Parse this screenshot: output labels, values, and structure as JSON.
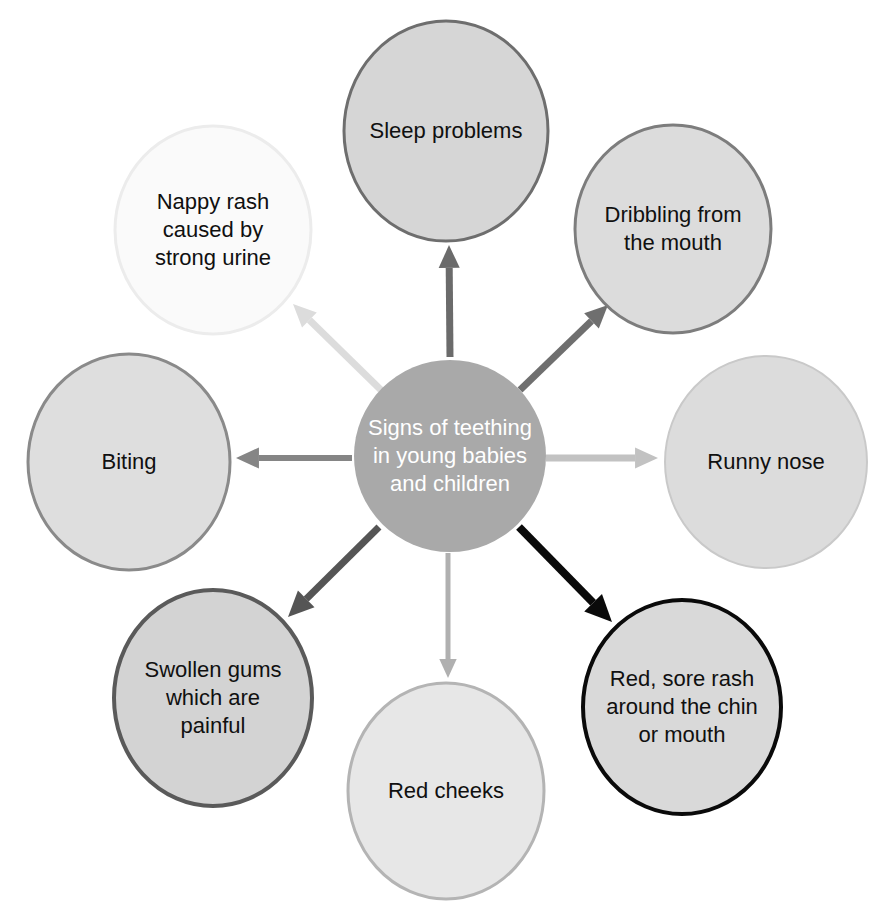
{
  "diagram": {
    "title": "Signs of teething in young babies and children",
    "type": "radial-hub-and-spoke",
    "canvas": {
      "width": 891,
      "height": 920,
      "background": "#ffffff"
    },
    "center": {
      "id": "center-node",
      "label": "Signs of teething\nin young babies\nand children",
      "label_lines": [
        "Signs of teething",
        "in young babies",
        "and children"
      ],
      "cx": 450,
      "cy": 456,
      "rx": 96,
      "ry": 96,
      "fill": "#a9a9a9",
      "stroke": "#a9a9a9",
      "stroke_width": 0,
      "text_color": "#ffffff",
      "font_size": 22
    },
    "nodes": [
      {
        "id": "node-sleep-problems",
        "label": "Sleep problems",
        "label_lines": [
          "Sleep problems"
        ],
        "cx": 446,
        "cy": 131,
        "rx": 102,
        "ry": 110,
        "fill": "#d6d6d6",
        "stroke": "#6e6e6e",
        "stroke_width": 3,
        "text_color": "#101010",
        "font_size": 22
      },
      {
        "id": "node-dribbling",
        "label": "Dribbling from\nthe mouth",
        "label_lines": [
          "Dribbling from",
          "the mouth"
        ],
        "cx": 673,
        "cy": 229,
        "rx": 98,
        "ry": 104,
        "fill": "#dcdcdc",
        "stroke": "#7d7d7d",
        "stroke_width": 3,
        "text_color": "#101010",
        "font_size": 22
      },
      {
        "id": "node-runny-nose",
        "label": "Runny nose",
        "label_lines": [
          "Runny nose"
        ],
        "cx": 766,
        "cy": 462,
        "rx": 101,
        "ry": 106,
        "fill": "#dcdcdc",
        "stroke": "#c9c9c9",
        "stroke_width": 2,
        "text_color": "#101010",
        "font_size": 22
      },
      {
        "id": "node-red-sore-rash",
        "label": "Red, sore rash\naround the chin\nor mouth",
        "label_lines": [
          "Red, sore rash",
          "around the chin",
          "or mouth"
        ],
        "cx": 682,
        "cy": 707,
        "rx": 99,
        "ry": 107,
        "fill": "#d9d9d9",
        "stroke": "#0a0a0a",
        "stroke_width": 4,
        "text_color": "#101010",
        "font_size": 22
      },
      {
        "id": "node-red-cheeks",
        "label": "Red cheeks",
        "label_lines": [
          "Red cheeks"
        ],
        "cx": 446,
        "cy": 791,
        "rx": 98,
        "ry": 108,
        "fill": "#e7e7e7",
        "stroke": "#b4b4b4",
        "stroke_width": 3,
        "text_color": "#101010",
        "font_size": 22
      },
      {
        "id": "node-swollen-gums",
        "label": "Swollen gums\nwhich are\npainful",
        "label_lines": [
          "Swollen gums",
          "which are",
          "painful"
        ],
        "cx": 213,
        "cy": 698,
        "rx": 99,
        "ry": 108,
        "fill": "#d3d3d3",
        "stroke": "#5a5a5a",
        "stroke_width": 4,
        "text_color": "#101010",
        "font_size": 22
      },
      {
        "id": "node-biting",
        "label": "Biting",
        "label_lines": [
          "Biting"
        ],
        "cx": 129,
        "cy": 462,
        "rx": 101,
        "ry": 108,
        "fill": "#dedede",
        "stroke": "#8a8a8a",
        "stroke_width": 3,
        "text_color": "#101010",
        "font_size": 22
      },
      {
        "id": "node-nappy-rash",
        "label": "Nappy rash\ncaused by\nstrong urine",
        "label_lines": [
          "Nappy rash",
          "caused by",
          "strong urine"
        ],
        "cx": 213,
        "cy": 230,
        "rx": 98,
        "ry": 104,
        "fill": "#fafafa",
        "stroke": "#ececec",
        "stroke_width": 3,
        "text_color": "#101010",
        "font_size": 22
      }
    ],
    "arrows": [
      {
        "id": "arrow-to-sleep-problems",
        "from": "center-node",
        "to": "node-sleep-problems",
        "x1": 450,
        "y1": 357,
        "x2": 449,
        "y2": 245,
        "color": "#6b6b6b",
        "width": 7,
        "head": 17
      },
      {
        "id": "arrow-to-dribbling",
        "from": "center-node",
        "to": "node-dribbling",
        "x1": 520,
        "y1": 390,
        "x2": 608,
        "y2": 305,
        "color": "#6f6f6f",
        "width": 7,
        "head": 17
      },
      {
        "id": "arrow-to-runny-nose",
        "from": "center-node",
        "to": "node-runny-nose",
        "x1": 546,
        "y1": 458,
        "x2": 658,
        "y2": 458,
        "color": "#c2c2c2",
        "width": 7,
        "head": 17
      },
      {
        "id": "arrow-to-red-sore-rash",
        "from": "center-node",
        "to": "node-red-sore-rash",
        "x1": 519,
        "y1": 527,
        "x2": 612,
        "y2": 622,
        "color": "#0a0a0a",
        "width": 8,
        "head": 20
      },
      {
        "id": "arrow-to-red-cheeks",
        "from": "center-node",
        "to": "node-red-cheeks",
        "x1": 448,
        "y1": 553,
        "x2": 448,
        "y2": 678,
        "color": "#b0b0b0",
        "width": 5,
        "head": 14
      },
      {
        "id": "arrow-to-swollen-gums",
        "from": "center-node",
        "to": "node-swollen-gums",
        "x1": 379,
        "y1": 527,
        "x2": 288,
        "y2": 617,
        "color": "#555555",
        "width": 7,
        "head": 19
      },
      {
        "id": "arrow-to-biting",
        "from": "center-node",
        "to": "node-biting",
        "x1": 352,
        "y1": 458,
        "x2": 236,
        "y2": 458,
        "color": "#858585",
        "width": 6,
        "head": 17
      },
      {
        "id": "arrow-to-nappy-rash",
        "from": "center-node",
        "to": "node-nappy-rash",
        "x1": 381,
        "y1": 390,
        "x2": 293,
        "y2": 304,
        "color": "#dcdcdc",
        "width": 7,
        "head": 17
      }
    ]
  }
}
